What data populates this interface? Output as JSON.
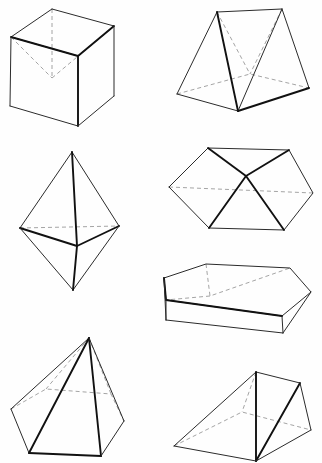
{
  "page": {
    "background_color": "#fefefe",
    "width": 322,
    "height": 463,
    "line_color": "#2b2b2b",
    "bold_line_color": "#111111",
    "hidden_line_color": "#9a9a9a"
  },
  "figures": [
    {
      "id": "cube",
      "name": "Cube",
      "position": "top-left",
      "row": 1,
      "column": 1,
      "faces": 6,
      "vertices": 8,
      "edges": 12,
      "visible_vertices": 7,
      "hidden_vertices": 1,
      "geometry": {
        "top_back": [
          52,
          9
        ],
        "top_left": [
          11,
          37
        ],
        "top_right": [
          114,
          26
        ],
        "top_front": [
          78,
          56
        ],
        "bottom_left": [
          10,
          106
        ],
        "bottom_front": [
          78,
          126
        ],
        "bottom_right": [
          114,
          96
        ],
        "bottom_back_hidden": [
          52,
          78
        ]
      }
    },
    {
      "id": "tent-prism",
      "name": "Triangular prism (tent)",
      "position": "top-right",
      "row": 1,
      "column": 2,
      "faces": 5,
      "vertices": 6,
      "edges": 9,
      "geometry": {
        "ridge_front": [
          217,
          12
        ],
        "ridge_back": [
          282,
          9
        ],
        "base_left_front": [
          177,
          94
        ],
        "base_front": [
          238,
          111
        ],
        "base_right": [
          309,
          88
        ],
        "base_back_hidden": [
          250,
          74
        ]
      }
    },
    {
      "id": "octahedron",
      "name": "Octahedron (square bipyramid)",
      "position": "middle-left",
      "row": 2,
      "column": 1,
      "faces": 8,
      "vertices": 6,
      "edges": 12,
      "geometry": {
        "apex_top": [
          72,
          152
        ],
        "apex_bottom": [
          73,
          290
        ],
        "equator_left": [
          20,
          228
        ],
        "equator_right": [
          119,
          226
        ],
        "equator_front": [
          77,
          246
        ],
        "equator_back_hidden": [
          66,
          210
        ]
      }
    },
    {
      "id": "flat-bipyramid",
      "name": "Flattened bipyramid",
      "position": "middle-right",
      "row": 2,
      "column": 2,
      "faces": 8,
      "vertices": 6,
      "edges": 12,
      "geometry": {
        "center_apex": [
          246,
          176
        ],
        "left": [
          169,
          187
        ],
        "right": [
          313,
          193
        ],
        "top_left": [
          208,
          148
        ],
        "top_right": [
          289,
          150
        ],
        "bottom_left": [
          209,
          228
        ],
        "bottom_right": [
          284,
          230
        ]
      }
    },
    {
      "id": "flat-wedge",
      "name": "Flat wedge prism",
      "position": "middle-lower-right",
      "row": 3,
      "column": 2,
      "faces": 6,
      "vertices": 8,
      "edges": 12,
      "geometry": {
        "top_left": [
          164,
          278
        ],
        "top_back_left": [
          206,
          264
        ],
        "top_back_right": [
          290,
          268
        ],
        "top_right": [
          311,
          292
        ],
        "front_right": [
          282,
          316
        ],
        "front_left": [
          166,
          300
        ],
        "bottom_front_left": [
          166,
          320
        ],
        "bottom_front_right": [
          283,
          333
        ]
      }
    },
    {
      "id": "hexagonal-pyramid",
      "name": "Hexagonal pyramid",
      "position": "bottom-left",
      "row": 4,
      "column": 1,
      "faces": 7,
      "vertices": 7,
      "edges": 12,
      "geometry": {
        "apex": [
          89,
          338
        ],
        "base_left": [
          11,
          409
        ],
        "base_front_left": [
          29,
          453
        ],
        "base_front_right": [
          101,
          456
        ],
        "base_right": [
          124,
          421
        ],
        "base_back_right_hidden": [
          111,
          394
        ],
        "base_back_left_hidden": [
          46,
          389
        ]
      }
    },
    {
      "id": "slanted-prism",
      "name": "Slanted triangular prism",
      "position": "bottom-right",
      "row": 4,
      "column": 2,
      "faces": 5,
      "vertices": 6,
      "edges": 9,
      "geometry": {
        "ridge_front": [
          256,
          372
        ],
        "ridge_back": [
          300,
          383
        ],
        "base_left": [
          174,
          446
        ],
        "base_front": [
          256,
          461
        ],
        "base_right": [
          311,
          430
        ],
        "base_back_hidden": [
          242,
          412
        ]
      }
    }
  ]
}
